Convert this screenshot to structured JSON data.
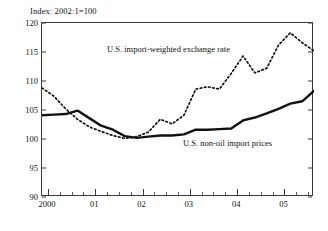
{
  "figure": {
    "unit_label": "Index: 2002:1=100"
  },
  "chart_data": {
    "type": "line",
    "title": "",
    "subtitle": "",
    "xlabel": "",
    "ylabel": "Index: 2002:1=100",
    "ylim": [
      90,
      120
    ],
    "xlim": [
      1999.875,
      2005.625
    ],
    "yticks": [
      90,
      95,
      100,
      105,
      110,
      115,
      120
    ],
    "ytick_labels": [
      "90",
      "95",
      "100",
      "105",
      "110",
      "115",
      "120"
    ],
    "xtick_major": [
      2000,
      2001,
      2002,
      2003,
      2004,
      2005
    ],
    "xtick_labels": [
      "2000",
      "01",
      "02",
      "03",
      "04",
      "05"
    ],
    "xtick_minor_per_year": 4,
    "grid": false,
    "legend_position": "inline-annotations",
    "x": [
      1999.875,
      2000.125,
      2000.375,
      2000.625,
      2000.875,
      2001.125,
      2001.375,
      2001.625,
      2001.875,
      2002.125,
      2002.375,
      2002.625,
      2002.875,
      2003.125,
      2003.375,
      2003.625,
      2003.875,
      2004.125,
      2004.375,
      2004.625,
      2004.875,
      2005.125,
      2005.375,
      2005.625
    ],
    "series": [
      {
        "name": "U.S. import-weighted exchange rate",
        "style": "dotted",
        "color": "#111111",
        "values": [
          108.8,
          107.4,
          105.2,
          103.4,
          102.1,
          101.3,
          100.6,
          100.1,
          100.4,
          101.2,
          103.4,
          102.6,
          104.1,
          108.6,
          109.0,
          108.6,
          111.3,
          114.3,
          111.4,
          112.2,
          116.2,
          118.3,
          116.6,
          115.2
        ]
      },
      {
        "name": "U.S. non-oil import prices",
        "style": "solid",
        "color": "#111111",
        "values": [
          104.1,
          104.2,
          104.3,
          104.9,
          103.6,
          102.3,
          101.6,
          100.5,
          100.2,
          100.4,
          100.6,
          100.6,
          100.8,
          101.6,
          101.6,
          101.7,
          101.8,
          103.2,
          103.7,
          104.4,
          105.2,
          106.1,
          106.5,
          108.3
        ]
      }
    ],
    "annotations": [
      {
        "text": "U.S. import-weighted exchange rate",
        "series": "U.S. import-weighted exchange rate"
      },
      {
        "text": "U.S. non-oil import prices",
        "series": "U.S. non-oil import prices"
      }
    ]
  }
}
